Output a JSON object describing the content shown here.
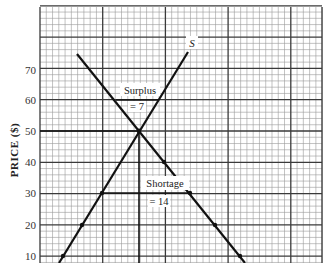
{
  "chart_data": {
    "type": "line",
    "title": "",
    "xlabel": "",
    "ylabel": "PRICE ($)",
    "ylim": [
      0,
      90
    ],
    "yticks": [
      10,
      20,
      30,
      40,
      50,
      60,
      70
    ],
    "grid": true,
    "series": [
      {
        "name": "S",
        "label": "S",
        "kind": "supply",
        "points": [
          {
            "price": 10,
            "marked": true
          },
          {
            "price": 20,
            "marked": true
          },
          {
            "price": 30,
            "marked": true
          },
          {
            "price": 50,
            "marked": true
          },
          {
            "price": 75,
            "marked": false
          }
        ]
      },
      {
        "name": "D",
        "label": "",
        "kind": "demand",
        "points": [
          {
            "price": 75,
            "marked": false
          },
          {
            "price": 50,
            "marked": true
          },
          {
            "price": 40,
            "marked": true
          },
          {
            "price": 30,
            "marked": true
          },
          {
            "price": 20,
            "marked": true
          },
          {
            "price": 10,
            "marked": true
          }
        ]
      }
    ],
    "equilibrium": {
      "price": 50
    },
    "annotations": [
      {
        "text": "Surplus",
        "subtext": "= 7",
        "price": 60
      },
      {
        "text": "Shortage",
        "subtext": "= 14",
        "price": 30
      }
    ]
  },
  "labels": {
    "y_axis": "PRICE ($)",
    "supply_curve": "S",
    "surplus": "Surplus",
    "surplus_value": "= 7",
    "shortage": "Shortage",
    "shortage_value": "= 14",
    "ticks": [
      "70",
      "60",
      "50",
      "40",
      "30",
      "20",
      "10"
    ]
  },
  "colors": {
    "grid_minor": "#9a9a9a",
    "grid_major": "#3a3a3a",
    "curve": "#111111",
    "background": "#ffffff"
  }
}
